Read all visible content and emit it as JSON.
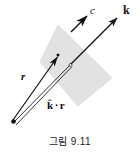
{
  "figure": {
    "caption": "그림 9.11",
    "plane": {
      "name": "wavefront-plane",
      "fill_color": "#e2e2e2",
      "stroke_color": "#d2d2d2",
      "points": "58,25 40,62 78,106 112,78"
    },
    "labels": {
      "c": "c",
      "k": "k",
      "r": "r",
      "k_hat": "k",
      "dot": "·",
      "r2": "r"
    },
    "vectors": [
      {
        "name": "vector-c",
        "label": "c",
        "from_x": 71,
        "from_y": 32,
        "to_x": 88,
        "to_y": 15
      },
      {
        "name": "vector-k",
        "label": "k",
        "from_x": 71,
        "from_y": 64,
        "to_x": 119,
        "to_y": 16
      },
      {
        "name": "vector-r",
        "label": "r",
        "from_x": 13,
        "from_y": 121,
        "to_x": 58,
        "to_y": 56
      },
      {
        "name": "vector-k-dot-r",
        "label": "k · r",
        "from_x": 15,
        "from_y": 123,
        "to_x": 70,
        "to_y": 65
      }
    ],
    "points": [
      {
        "name": "origin-point",
        "x": 13,
        "y": 121
      },
      {
        "name": "r-tip-point",
        "x": 58,
        "y": 55
      }
    ],
    "colors": {
      "ink": "#111111",
      "plane_fill": "#e2e2e2",
      "background": "#ffffff"
    }
  }
}
